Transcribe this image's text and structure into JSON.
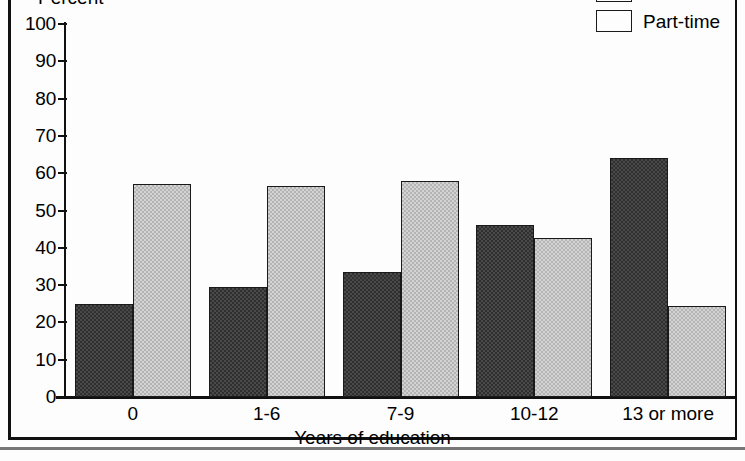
{
  "chart_data": {
    "type": "bar",
    "title": "",
    "ylabel": "Percent",
    "xlabel": "Years of education",
    "categories": [
      "0",
      "1-6",
      "7-9",
      "10-12",
      "13 or more"
    ],
    "ylim": [
      0,
      100
    ],
    "ytick_labels": [
      "100",
      "90",
      "80",
      "70",
      "60",
      "50",
      "40",
      "30",
      "20",
      "10",
      "0"
    ],
    "ytick_values": [
      100,
      90,
      80,
      70,
      60,
      50,
      40,
      30,
      20,
      10,
      0
    ],
    "grid": false,
    "legend_position": "top-right",
    "series": [
      {
        "name": "Full time",
        "color": "#2f2f2f",
        "values": [
          25,
          29.5,
          33.5,
          46,
          64
        ]
      },
      {
        "name": "Part-time",
        "color": "#d3d3d3",
        "values": [
          57,
          56.5,
          58,
          42.5,
          24.5
        ]
      }
    ]
  }
}
